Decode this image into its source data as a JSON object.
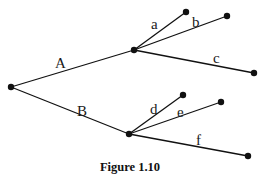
{
  "figure": {
    "caption": "Figure 1.10",
    "type": "tree-diagram",
    "nodes": {
      "root": {
        "x": 11,
        "y": 87
      },
      "nA": {
        "x": 134,
        "y": 50
      },
      "nB": {
        "x": 129,
        "y": 134
      },
      "la": {
        "x": 186,
        "y": 12
      },
      "lb": {
        "x": 227,
        "y": 16
      },
      "lc": {
        "x": 254,
        "y": 73
      },
      "ld": {
        "x": 183,
        "y": 95
      },
      "le": {
        "x": 221,
        "y": 102
      },
      "lf": {
        "x": 248,
        "y": 156
      }
    },
    "edges": [
      {
        "id": "A",
        "label": "A",
        "from": "root",
        "to": "nA",
        "label_x": 55,
        "label_y": 68
      },
      {
        "id": "B",
        "label": "B",
        "from": "root",
        "to": "nB",
        "label_x": 77,
        "label_y": 116
      },
      {
        "id": "a",
        "label": "a",
        "from": "nA",
        "to": "la",
        "label_x": 151,
        "label_y": 29
      },
      {
        "id": "b",
        "label": "b",
        "from": "nA",
        "to": "lb",
        "label_x": 192,
        "label_y": 27
      },
      {
        "id": "c",
        "label": "c",
        "from": "nA",
        "to": "lc",
        "label_x": 213,
        "label_y": 63
      },
      {
        "id": "d",
        "label": "d",
        "from": "nB",
        "to": "ld",
        "label_x": 150,
        "label_y": 114
      },
      {
        "id": "e",
        "label": "e",
        "from": "nB",
        "to": "le",
        "label_x": 177,
        "label_y": 117
      },
      {
        "id": "f",
        "label": "f",
        "from": "nB",
        "to": "lf",
        "label_x": 196,
        "label_y": 145
      }
    ]
  }
}
